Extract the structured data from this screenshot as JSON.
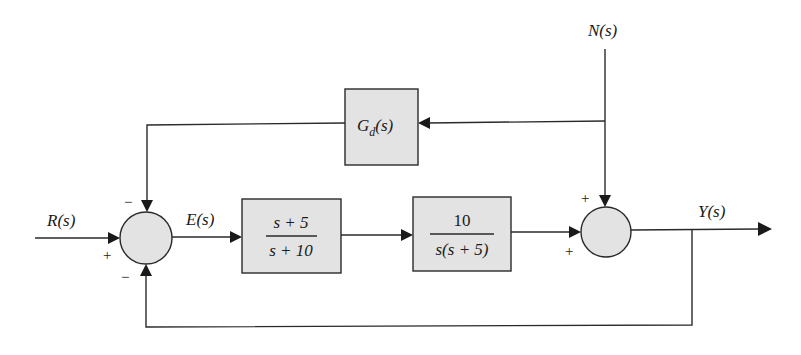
{
  "diagram": {
    "type": "control-system-block-diagram",
    "signals": {
      "input": "R(s)",
      "error": "E(s)",
      "output": "Y(s)",
      "disturbance": "N(s)"
    },
    "blocks": {
      "controller": {
        "numerator": "s + 5",
        "denominator": "s + 10"
      },
      "plant": {
        "numerator": "10",
        "denominator": "s(s + 5)"
      },
      "disturbance_feedforward": {
        "label_main": "G",
        "label_sub": "d",
        "label_arg": "(s)"
      }
    },
    "junctions": {
      "left": {
        "top_sign": "−",
        "left_sign": "+",
        "bottom_sign": "−"
      },
      "right": {
        "top_sign": "+",
        "left_sign": "+"
      }
    },
    "colors": {
      "block_fill": "#e3e3e3",
      "line": "#2a2a2a",
      "background": "#ffffff"
    }
  }
}
